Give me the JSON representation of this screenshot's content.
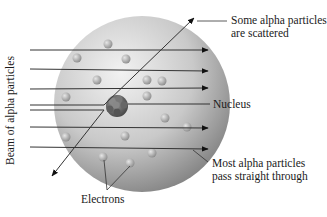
{
  "labels": {
    "scattered_line1": "Some alpha particles",
    "scattered_line2": "are scattered",
    "nucleus": "Nucleus",
    "straight_line1": "Most alpha particles",
    "straight_line2": "pass straight through",
    "electrons": "Electrons",
    "beam": "Beam of alpha particles"
  },
  "colors": {
    "atom_light": "#e8e8e8",
    "atom_dark": "#8a8a8a",
    "nucleus": "#6b6b6b",
    "line": "#333333",
    "text": "#1a1a1a"
  },
  "beam_lines_y": [
    50,
    69,
    89,
    105,
    110,
    127,
    147
  ]
}
